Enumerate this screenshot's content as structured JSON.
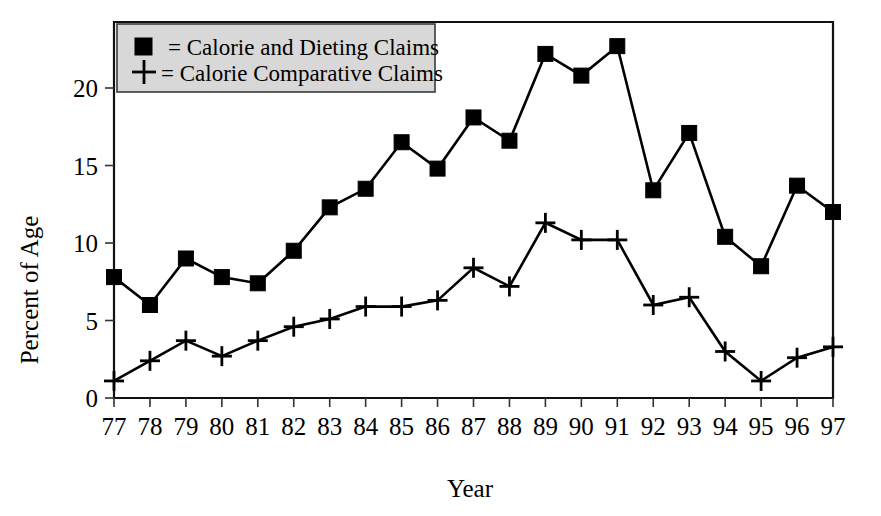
{
  "chart_data": {
    "type": "line",
    "title": "",
    "xlabel": "Year",
    "ylabel": "Percent of Age",
    "categories": [
      "77",
      "78",
      "79",
      "80",
      "81",
      "82",
      "83",
      "84",
      "85",
      "86",
      "87",
      "88",
      "89",
      "90",
      "91",
      "92",
      "93",
      "94",
      "95",
      "96",
      "97"
    ],
    "x_tick_labels": [
      "77",
      "78",
      "79",
      "80",
      "81",
      "82",
      "83",
      "84",
      "85",
      "86",
      "87",
      "88",
      "89",
      "90",
      "91",
      "92",
      "93",
      "94",
      "95",
      "96",
      "97"
    ],
    "y_tick_labels": [
      "0",
      "5",
      "10",
      "15",
      "20"
    ],
    "y_ticks": [
      0,
      5,
      10,
      15,
      20
    ],
    "ylim": [
      0,
      24.2
    ],
    "xlim": [
      1976.6,
      1997.6
    ],
    "grid": false,
    "legend_position": "top-left",
    "series": [
      {
        "name": "= Calorie and Dieting Claims",
        "marker": "square",
        "color": "#000000",
        "values": [
          7.8,
          6.0,
          9.0,
          7.8,
          7.4,
          9.5,
          12.3,
          13.5,
          16.5,
          14.8,
          18.1,
          16.6,
          22.2,
          20.8,
          22.7,
          13.4,
          17.1,
          10.4,
          8.5,
          13.7,
          12.0
        ]
      },
      {
        "name": "= Calorie Comparative Claims",
        "marker": "cross",
        "color": "#000000",
        "values": [
          1.1,
          2.4,
          3.7,
          2.7,
          3.7,
          4.6,
          5.1,
          5.9,
          5.9,
          6.3,
          8.4,
          7.2,
          11.3,
          10.2,
          10.2,
          6.0,
          6.5,
          3.0,
          1.1,
          2.6,
          3.3
        ]
      }
    ]
  },
  "legend": {
    "entries": [
      {
        "marker": "square-marker-icon",
        "label": "= Calorie and Dieting Claims"
      },
      {
        "marker": "cross-marker-icon",
        "label": "= Calorie Comparative Claims"
      }
    ]
  },
  "axes": {
    "y_title": "Percent of Age",
    "x_title": "Year"
  }
}
